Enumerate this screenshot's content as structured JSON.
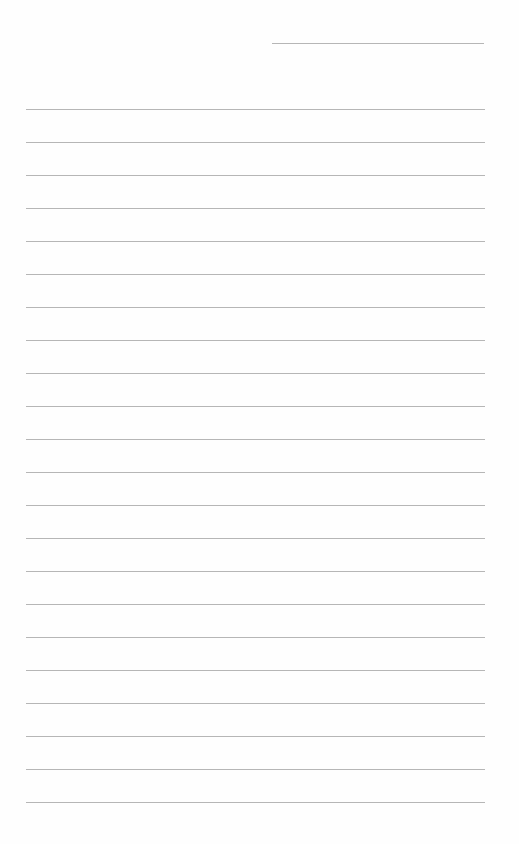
{
  "page": {
    "type": "lined-notebook-page",
    "background_color": "#fefefe",
    "line_color": "#a9a9a9",
    "header_line": {
      "present": true,
      "x_start": 272,
      "x_end": 484,
      "y": 43
    },
    "ruled_lines": {
      "count": 22,
      "first_y": 109,
      "spacing": 33,
      "x_start": 26,
      "x_end": 485
    },
    "text_content": []
  }
}
